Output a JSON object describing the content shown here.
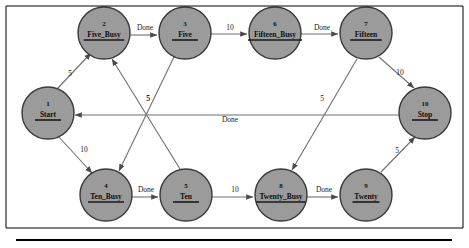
{
  "diagram": {
    "type": "state-machine-graph",
    "colors": {
      "node_fill": "#9b9b9b",
      "node_stroke": "#3a3a3a",
      "edge_stroke": "#6f6f6f",
      "text": "#111111",
      "background": "#ffffff"
    },
    "nodes": [
      {
        "id": "1",
        "label": "Start",
        "cx": 48,
        "cy": 113,
        "r": 26
      },
      {
        "id": "2",
        "label": "Five_Busy",
        "cx": 104,
        "cy": 33,
        "r": 26
      },
      {
        "id": "3",
        "label": "Five",
        "cx": 185,
        "cy": 33,
        "r": 26
      },
      {
        "id": "4",
        "label": "Ten_Busy",
        "cx": 106,
        "cy": 195,
        "r": 26
      },
      {
        "id": "5",
        "label": "Ten",
        "cx": 186,
        "cy": 195,
        "r": 26
      },
      {
        "id": "6",
        "label": "Fifteen_Busy",
        "cx": 275,
        "cy": 33,
        "r": 26
      },
      {
        "id": "7",
        "label": "Fifteen",
        "cx": 366,
        "cy": 33,
        "r": 26
      },
      {
        "id": "8",
        "label": "Twenty_Busy",
        "cx": 281,
        "cy": 195,
        "r": 26
      },
      {
        "id": "9",
        "label": "Twenty",
        "cx": 366,
        "cy": 195,
        "r": 26
      },
      {
        "id": "10",
        "label": "Stop",
        "cx": 425,
        "cy": 113,
        "r": 26
      }
    ],
    "edges": [
      {
        "from": "1",
        "to": "2",
        "label": "5",
        "lx": 70,
        "ly": 76,
        "x1": 57,
        "y1": 89,
        "x2": 91,
        "y2": 53
      },
      {
        "from": "1",
        "to": "4",
        "label": "10",
        "lx": 84,
        "ly": 152,
        "x1": 58,
        "y1": 136,
        "x2": 92,
        "y2": 173
      },
      {
        "from": "2",
        "to": "3",
        "label": "Done",
        "lx": 145,
        "ly": 30,
        "x1": 130,
        "y1": 35,
        "x2": 157,
        "y2": 35
      },
      {
        "from": "3",
        "to": "6",
        "label": "10",
        "lx": 230,
        "ly": 30,
        "x1": 211,
        "y1": 34,
        "x2": 247,
        "y2": 34
      },
      {
        "from": "3",
        "to": "4",
        "label": "5",
        "lx": 148,
        "ly": 101,
        "x1": 174,
        "y1": 57,
        "x2": 119,
        "y2": 171
      },
      {
        "from": "4",
        "to": "5",
        "label": "Done",
        "lx": 146,
        "ly": 192,
        "x1": 132,
        "y1": 197,
        "x2": 158,
        "y2": 197
      },
      {
        "from": "5",
        "to": "8",
        "label": "10",
        "lx": 235,
        "ly": 192,
        "x1": 212,
        "y1": 197,
        "x2": 253,
        "y2": 197
      },
      {
        "from": "5",
        "to": "2",
        "label": "5",
        "lx": 148,
        "ly": 101,
        "x1": 180,
        "y1": 169,
        "x2": 112,
        "y2": 59
      },
      {
        "from": "6",
        "to": "7",
        "label": "Done",
        "lx": 322,
        "ly": 30,
        "x1": 301,
        "y1": 34,
        "x2": 338,
        "y2": 34
      },
      {
        "from": "7",
        "to": "10",
        "label": "10",
        "lx": 400,
        "ly": 75,
        "x1": 379,
        "y1": 57,
        "x2": 414,
        "y2": 88
      },
      {
        "from": "7",
        "to": "8",
        "label": "5",
        "lx": 322,
        "ly": 101,
        "x1": 357,
        "y1": 59,
        "x2": 292,
        "y2": 170
      },
      {
        "from": "8",
        "to": "9",
        "label": "Done",
        "lx": 324,
        "ly": 192,
        "x1": 307,
        "y1": 197,
        "x2": 338,
        "y2": 197
      },
      {
        "from": "9",
        "to": "10",
        "label": "5",
        "lx": 397,
        "ly": 153,
        "x1": 381,
        "y1": 172,
        "x2": 415,
        "y2": 137
      },
      {
        "from": "10",
        "to": "1",
        "label": "Done",
        "lx": 230,
        "ly": 122,
        "x1": 399,
        "y1": 115,
        "x2": 75,
        "y2": 115
      }
    ]
  }
}
